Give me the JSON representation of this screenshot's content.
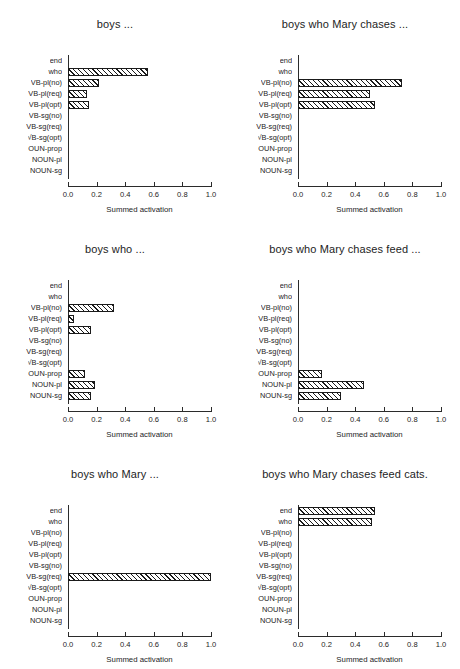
{
  "figure": {
    "y_categories": [
      "end",
      "who",
      "VB-pl(no)",
      "VB-pl(req)",
      "VB-pl(opt)",
      "VB-sg(no)",
      "VB-sg(req)",
      "VB-sg(opt)",
      "NOUN-prop",
      "NOUN-pl",
      "NOUN-sg"
    ],
    "y_categories_rendered": [
      "end",
      "who",
      "VB-pl(no)",
      "VB-pl(req)",
      "VB-pl(opt)",
      "VB-sg(no)",
      "VB-sg(req)",
      "√B-sg(opt)",
      "OUN-prop",
      "NOUN-pl",
      "NOUN-sg"
    ],
    "xlabel": "Summed activation",
    "xticks": [
      "0.0",
      "0.2",
      "0.4",
      "0.6",
      "0.8",
      "1.0"
    ],
    "xtick_values": [
      0.0,
      0.2,
      0.4,
      0.6,
      0.8,
      1.0
    ],
    "xlim": [
      0.0,
      1.0
    ],
    "bar_edge_color": "#1a1a1a",
    "bar_fill": "hatched-diagonal"
  },
  "chart_data": [
    {
      "type": "bar",
      "orientation": "horizontal",
      "title": "boys ...",
      "xlabel": "Summed activation",
      "ylabel": "",
      "xlim": [
        0.0,
        1.0
      ],
      "grid": false,
      "categories": [
        "end",
        "who",
        "VB-pl(no)",
        "VB-pl(req)",
        "VB-pl(opt)",
        "VB-sg(no)",
        "VB-sg(req)",
        "VB-sg(opt)",
        "NOUN-prop",
        "NOUN-pl",
        "NOUN-sg"
      ],
      "values": [
        0.0,
        0.56,
        0.22,
        0.13,
        0.15,
        0.0,
        0.0,
        0.0,
        0.0,
        0.0,
        0.0
      ]
    },
    {
      "type": "bar",
      "orientation": "horizontal",
      "title": "boys who Mary chases ...",
      "xlabel": "Summed activation",
      "ylabel": "",
      "xlim": [
        0.0,
        1.0
      ],
      "grid": false,
      "categories": [
        "end",
        "who",
        "VB-pl(no)",
        "VB-pl(req)",
        "VB-pl(opt)",
        "VB-sg(no)",
        "VB-sg(req)",
        "VB-sg(opt)",
        "NOUN-prop",
        "NOUN-pl",
        "NOUN-sg"
      ],
      "values": [
        0.0,
        0.0,
        0.73,
        0.5,
        0.54,
        0.0,
        0.0,
        0.0,
        0.0,
        0.0,
        0.0
      ]
    },
    {
      "type": "bar",
      "orientation": "horizontal",
      "title": "boys who ...",
      "xlabel": "Summed activation",
      "ylabel": "",
      "xlim": [
        0.0,
        1.0
      ],
      "grid": false,
      "categories": [
        "end",
        "who",
        "VB-pl(no)",
        "VB-pl(req)",
        "VB-pl(opt)",
        "VB-sg(no)",
        "VB-sg(req)",
        "VB-sg(opt)",
        "NOUN-prop",
        "NOUN-pl",
        "NOUN-sg"
      ],
      "values": [
        0.0,
        0.0,
        0.32,
        0.04,
        0.16,
        0.0,
        0.0,
        0.0,
        0.12,
        0.19,
        0.16
      ]
    },
    {
      "type": "bar",
      "orientation": "horizontal",
      "title": "boys who Mary chases feed ...",
      "xlabel": "Summed activation",
      "ylabel": "",
      "xlim": [
        0.0,
        1.0
      ],
      "grid": false,
      "categories": [
        "end",
        "who",
        "VB-pl(no)",
        "VB-pl(req)",
        "VB-pl(opt)",
        "VB-sg(no)",
        "VB-sg(req)",
        "VB-sg(opt)",
        "NOUN-prop",
        "NOUN-pl",
        "NOUN-sg"
      ],
      "values": [
        0.0,
        0.0,
        0.0,
        0.0,
        0.0,
        0.0,
        0.0,
        0.0,
        0.165,
        0.46,
        0.3
      ]
    },
    {
      "type": "bar",
      "orientation": "horizontal",
      "title": "boys who Mary ...",
      "xlabel": "Summed activation",
      "ylabel": "",
      "xlim": [
        0.0,
        1.0
      ],
      "grid": false,
      "categories": [
        "end",
        "who",
        "VB-pl(no)",
        "VB-pl(req)",
        "VB-pl(opt)",
        "VB-sg(no)",
        "VB-sg(req)",
        "VB-sg(opt)",
        "NOUN-prop",
        "NOUN-pl",
        "NOUN-sg"
      ],
      "values": [
        0.0,
        0.0,
        0.0,
        0.0,
        0.0,
        0.0,
        1.0,
        0.0,
        0.0,
        0.0,
        0.0
      ]
    },
    {
      "type": "bar",
      "orientation": "horizontal",
      "title": "boys who Mary chases feed cats.",
      "xlabel": "Summed activation",
      "ylabel": "",
      "xlim": [
        0.0,
        1.0
      ],
      "grid": false,
      "categories": [
        "end",
        "who",
        "VB-pl(no)",
        "VB-pl(req)",
        "VB-pl(opt)",
        "VB-sg(no)",
        "VB-sg(req)",
        "VB-sg(opt)",
        "NOUN-prop",
        "NOUN-pl",
        "NOUN-sg"
      ],
      "values": [
        0.54,
        0.52,
        0.0,
        0.0,
        0.0,
        0.0,
        0.0,
        0.0,
        0.0,
        0.0,
        0.0
      ]
    }
  ]
}
